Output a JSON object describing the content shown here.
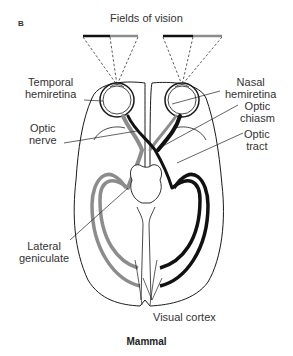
{
  "figure": {
    "panel_letter": "B",
    "title": "Fields of vision",
    "caption": "Mammal"
  },
  "labels": {
    "temporal_hemiretina": [
      "Temporal",
      "hemiretina"
    ],
    "nasal_hemiretina": [
      "Nasal",
      "hemiretina"
    ],
    "optic_nerve": [
      "Optic",
      "nerve"
    ],
    "optic_chiasm": [
      "Optic",
      "chiasm"
    ],
    "optic_tract": [
      "Optic",
      "tract"
    ],
    "lateral_geniculate": [
      "Lateral",
      "geniculate"
    ],
    "visual_cortex": "Visual cortex"
  },
  "colors": {
    "left_field": "#111111",
    "right_field": "#8c8c8c",
    "outline": "#1a1a1a"
  }
}
